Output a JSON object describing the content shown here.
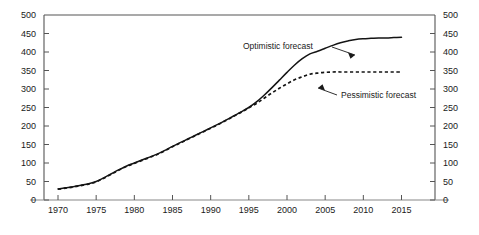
{
  "chart_data": {
    "type": "line",
    "title": "",
    "subtitle": "",
    "xlabel": "",
    "ylabel": "",
    "xlim": [
      1968,
      2017
    ],
    "ylim": [
      0,
      500
    ],
    "grid": false,
    "legend_position": "inline-annotations",
    "x_ticks": [
      1970,
      1975,
      1980,
      1985,
      1990,
      1995,
      2000,
      2005,
      2010,
      2015
    ],
    "y_ticks": [
      0,
      50,
      100,
      150,
      200,
      250,
      300,
      350,
      400,
      450,
      500
    ],
    "y_ticks_right": [
      0,
      50,
      100,
      150,
      200,
      250,
      300,
      350,
      400,
      450,
      500
    ],
    "x": [
      1970,
      1971,
      1972,
      1973,
      1974,
      1975,
      1976,
      1977,
      1978,
      1979,
      1980,
      1981,
      1982,
      1983,
      1984,
      1985,
      1986,
      1987,
      1988,
      1989,
      1990,
      1991,
      1992,
      1993,
      1994,
      1995,
      1996,
      1997,
      1998,
      1999,
      2000,
      2001,
      2002,
      2003,
      2004,
      2005,
      2006,
      2007,
      2008,
      2009,
      2010,
      2011,
      2012,
      2013,
      2014,
      2015
    ],
    "series": [
      {
        "name": "Optimistic forecast",
        "style": "solid",
        "color": "#141414",
        "values": [
          30,
          33,
          36,
          40,
          44,
          50,
          60,
          71,
          82,
          92,
          100,
          108,
          116,
          124,
          134,
          145,
          155,
          165,
          175,
          185,
          195,
          205,
          216,
          227,
          238,
          250,
          265,
          283,
          303,
          324,
          345,
          365,
          382,
          395,
          402,
          410,
          418,
          425,
          430,
          434,
          436,
          437,
          438,
          438,
          439,
          440
        ]
      },
      {
        "name": "Pessimistic forecast",
        "style": "dashed",
        "color": "#141414",
        "values": [
          29,
          32,
          35,
          39,
          43,
          49,
          59,
          70,
          81,
          91,
          99,
          107,
          115,
          123,
          133,
          144,
          154,
          164,
          174,
          184,
          194,
          204,
          215,
          226,
          237,
          249,
          261,
          275,
          289,
          302,
          314,
          325,
          333,
          340,
          343,
          345,
          346,
          346,
          346,
          346,
          346,
          346,
          346,
          346,
          346,
          346
        ]
      }
    ],
    "annotations": [
      {
        "text": "Optimistic forecast",
        "target_series": "Optimistic forecast"
      },
      {
        "text": "Pessimistic forecast",
        "target_series": "Pessimistic forecast"
      }
    ]
  },
  "axes": {
    "left_tick_labels": [
      "500",
      "450",
      "400",
      "350",
      "300",
      "250",
      "200",
      "150",
      "100",
      "50",
      "0"
    ],
    "right_tick_labels": [
      "500",
      "450",
      "400",
      "350",
      "300",
      "250",
      "200",
      "150",
      "100",
      "50",
      "0"
    ],
    "bottom_tick_labels": [
      "1970",
      "1975",
      "1980",
      "1985",
      "1990",
      "1995",
      "2000",
      "2005",
      "2010",
      "2015"
    ]
  },
  "annotations": {
    "optimistic": "Optimistic forecast",
    "pessimistic": "Pessimistic forecast"
  },
  "colors": {
    "line": "#141414",
    "axis": "#555555",
    "text": "#1a1a1a",
    "background": "#ffffff"
  }
}
